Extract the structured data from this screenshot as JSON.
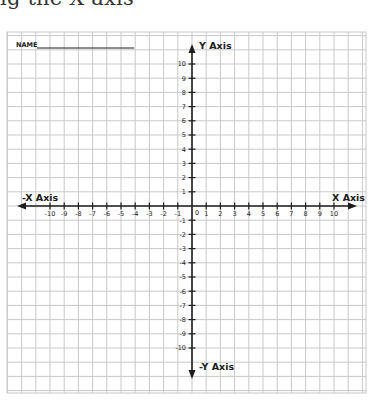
{
  "heading_fragment": "ig the X axis",
  "worksheet": {
    "name_label": "NAME",
    "name_value": "",
    "x_axis_label": "X Axis",
    "neg_x_axis_label": "-X Axis",
    "y_axis_label": "Y Axis",
    "neg_y_axis_label": "-Y Axis",
    "origin_label": "0",
    "x_tick_labels": [
      "-10",
      "-9",
      "-8",
      "-7",
      "-6",
      "-5",
      "-4",
      "-3",
      "-2",
      "-1",
      "1",
      "2",
      "3",
      "4",
      "5",
      "6",
      "7",
      "8",
      "9",
      "10"
    ],
    "y_tick_labels": [
      "10",
      "9",
      "8",
      "7",
      "6",
      "5",
      "4",
      "3",
      "2",
      "1",
      "-1",
      "-2",
      "-3",
      "-4",
      "-5",
      "-6",
      "-7",
      "-8",
      "-9",
      "-10"
    ]
  },
  "colors": {
    "grid": "#c9c9c9",
    "axis": "#1e1e1e",
    "background": "#ffffff"
  }
}
